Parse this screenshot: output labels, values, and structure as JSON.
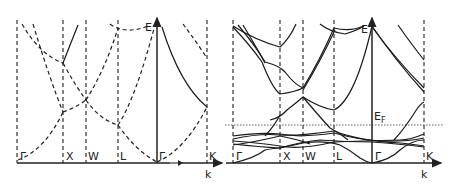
{
  "figure": {
    "panels": [
      {
        "id": "left",
        "title": "Free-electron (empty lattice) bands",
        "points": [
          "Γ",
          "X",
          "W",
          "L",
          "Γ",
          "K"
        ],
        "energy_label": "E",
        "k_label": "k"
      },
      {
        "id": "right",
        "title": "Real band structure",
        "points": [
          "Γ",
          "X",
          "W",
          "L",
          "Γ",
          "K"
        ],
        "energy_label": "E",
        "fermi_label": "E",
        "fermi_sub": "F",
        "k_label": "k"
      }
    ]
  }
}
